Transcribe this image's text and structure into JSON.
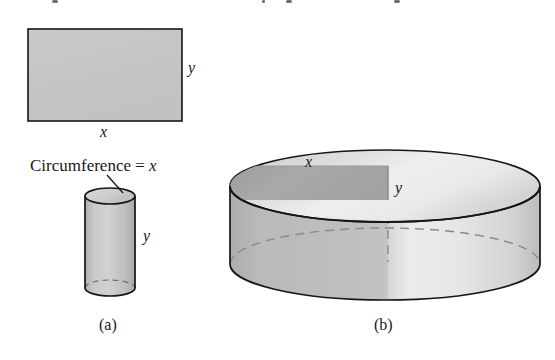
{
  "figure": {
    "panels": [
      {
        "id": "a",
        "caption": "(a)",
        "caption_x": 110,
        "caption_y": 332,
        "items": [
          {
            "name": "rectangle",
            "width_label": "x",
            "height_label": "y"
          },
          {
            "name": "cylinder",
            "annotation": "Circumference = ",
            "annotation_var": "x",
            "height_label": "y"
          }
        ]
      },
      {
        "id": "b",
        "caption": "(b)",
        "caption_x": 385,
        "caption_y": 332,
        "items": [
          {
            "name": "disk",
            "width_label": "x",
            "height_label": "y"
          }
        ]
      }
    ],
    "labels": {
      "rect_width": "x",
      "rect_height": "y",
      "circumference_text": "Circumference = ",
      "circumference_var": "x",
      "cylinder_height": "y",
      "disk_width": "x",
      "disk_height": "y",
      "caption_a": "(a)",
      "caption_b": "(b)"
    },
    "colors": {
      "background": "#ffffff",
      "outline": "#161616",
      "rect_fill": "#c6c6c6",
      "cylinder_body": "#c2c2c2",
      "cylinder_top": "#cfcfcf",
      "disk_top_light": "#e9e9e9",
      "disk_top_shaded": "#b9b9b9",
      "disk_inset_rect": "#a6a6a6",
      "disk_body_light": "#e2e2e2",
      "disk_body_shaded": "#c0c0c0",
      "dashed_line": "#8a8a8a"
    },
    "geometry": {
      "rect": {
        "x": 28,
        "y": 29,
        "w": 154,
        "h": 92
      },
      "small_cylinder": {
        "cx": 110,
        "rx": 25,
        "ry": 8,
        "top_y": 196,
        "bottom_y": 288
      },
      "disk": {
        "cx": 385,
        "rx": 155,
        "ry": 36,
        "top_y": 186,
        "bottom_y": 264
      },
      "disk_inset": {
        "x": 232,
        "y": 166,
        "w": 156,
        "h": 34
      }
    }
  }
}
